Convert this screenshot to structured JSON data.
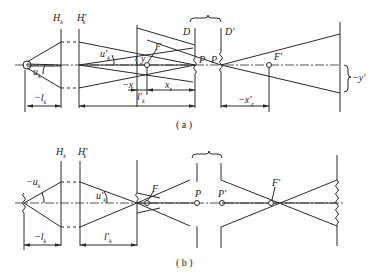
{
  "figure": {
    "panels": [
      {
        "id": "a",
        "caption": "( a )",
        "labels": {
          "H_k": "H",
          "H_k_sub": "k",
          "H_k_prime": "H'",
          "H_k_prime_sub": "k",
          "u_k_obj": "u",
          "u_k_obj_sub": "k",
          "u_k_img": "u'",
          "u_k_img_sub": "k",
          "y": "y",
          "F": "F",
          "D": "D",
          "D_prime": "D'",
          "P": "P",
          "P_prime": "P",
          "F_prime": "F'",
          "minus_y_prime": "−y'",
          "minus_l_k": "−l",
          "minus_l_k_sub": "k",
          "minus_x": "−x",
          "l_k_prime": "l'",
          "l_k_prime_sub": "k",
          "x_z": "x",
          "x_z_sub": "z",
          "minus_x_z_prime": "−x'",
          "minus_x_z_prime_sub": "z"
        }
      },
      {
        "id": "b",
        "caption": "( b )",
        "labels": {
          "H_k": "H",
          "H_k_sub": "k",
          "H_k_prime": "H'",
          "H_k_prime_sub": "k",
          "minus_u_k": "−u",
          "minus_u_k_sub": "k",
          "u_k_prime": "u'",
          "u_k_prime_sub": "k",
          "F": "F",
          "P": "P",
          "P_prime": "P'",
          "F_prime": "F'",
          "minus_l_k": "−l",
          "minus_l_k_sub": "k",
          "l_k_prime": "l'",
          "l_k_prime_sub": "k"
        }
      }
    ]
  }
}
